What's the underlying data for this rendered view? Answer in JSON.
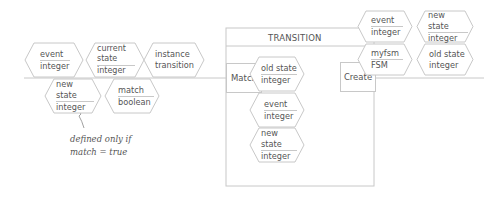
{
  "diagram": {
    "left_inputs": [
      {
        "name": "event",
        "type": "integer"
      },
      {
        "name": "current state",
        "type": "integer"
      },
      {
        "name": "instance",
        "type": "transition"
      }
    ],
    "left_outputs": [
      {
        "name": "new state",
        "type": "integer"
      },
      {
        "name": "match",
        "type": "boolean"
      }
    ],
    "annotation": {
      "line1": "defined only if",
      "line2": "match = true"
    },
    "class_box": {
      "title": "TRANSITION",
      "method_match": "Match",
      "method_create": "Create",
      "fields": [
        {
          "name": "old state",
          "type": "integer"
        },
        {
          "name": "event",
          "type": "integer"
        },
        {
          "name": "new state",
          "type": "integer"
        }
      ]
    },
    "right_inputs": [
      {
        "name": "event",
        "type": "integer"
      },
      {
        "name": "new state",
        "type": "integer"
      },
      {
        "name": "myfsm",
        "type": "FSM"
      },
      {
        "name": "old state",
        "type": "integer"
      }
    ]
  },
  "colors": {
    "stroke": "#c8c8c8",
    "text": "#555555"
  }
}
